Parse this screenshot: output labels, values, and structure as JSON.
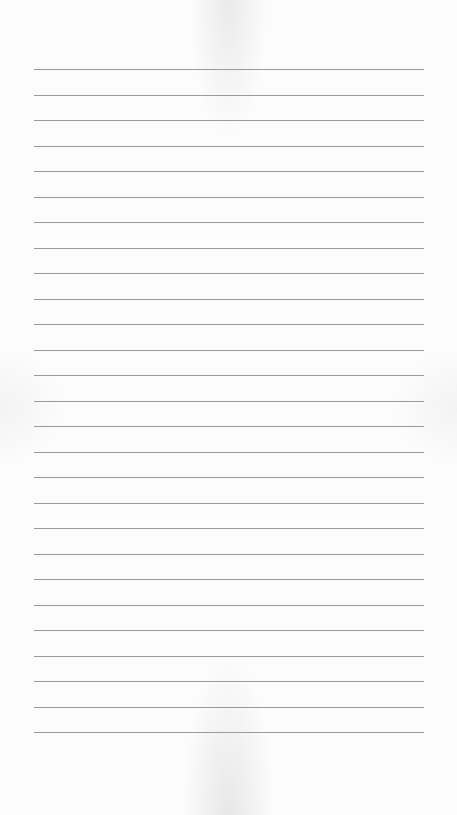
{
  "paper": {
    "type": "lined-paper",
    "line_count": 27,
    "first_line_y": 69,
    "line_spacing": 25.5,
    "line_left": 34,
    "line_width": 390,
    "line_color": "#9a9a9a",
    "background_color": "#fcfcfc"
  }
}
